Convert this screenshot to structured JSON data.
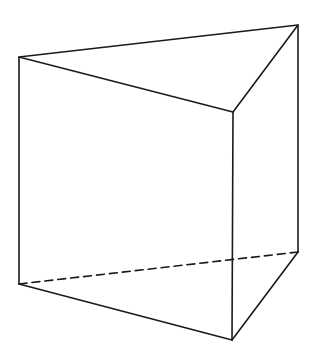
{
  "diagram": {
    "type": "triangular-prism",
    "stroke_color": "#1a1a1a",
    "background": "#ffffff",
    "vertices": {
      "A": [
        19,
        57
      ],
      "B": [
        298,
        25
      ],
      "C": [
        233,
        112
      ],
      "A1": [
        19,
        284
      ],
      "B1": [
        298,
        252
      ],
      "C1": [
        232,
        340
      ]
    },
    "solid_edges": [
      [
        "A",
        "B"
      ],
      [
        "B",
        "C"
      ],
      [
        "C",
        "A"
      ],
      [
        "A",
        "A1"
      ],
      [
        "B",
        "B1"
      ],
      [
        "C",
        "C1"
      ],
      [
        "A1",
        "C1"
      ],
      [
        "C1",
        "B1"
      ]
    ],
    "dashed_edges": [
      [
        "A1",
        "B1"
      ]
    ]
  }
}
